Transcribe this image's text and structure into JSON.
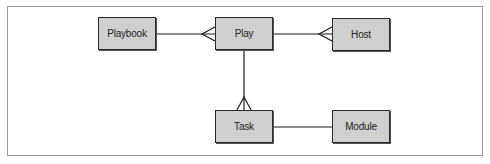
{
  "diagram": {
    "type": "entity-relationship",
    "nodes": [
      {
        "id": "playbook",
        "label": "Playbook"
      },
      {
        "id": "play",
        "label": "Play"
      },
      {
        "id": "host",
        "label": "Host"
      },
      {
        "id": "task",
        "label": "Task"
      },
      {
        "id": "module",
        "label": "Module"
      }
    ],
    "edges": [
      {
        "from": "playbook",
        "to": "play",
        "cardinality": "one-to-many"
      },
      {
        "from": "play",
        "to": "host",
        "cardinality": "many-to-many",
        "crowfoot_at": "host"
      },
      {
        "from": "play",
        "to": "task",
        "cardinality": "one-to-many"
      },
      {
        "from": "task",
        "to": "module",
        "cardinality": "one-to-one"
      }
    ],
    "colors": {
      "node_fill": "#cfcfcf",
      "node_border": "#2a2a2a",
      "edge": "#1a1a1a",
      "frame": "#9a9a9a"
    }
  }
}
